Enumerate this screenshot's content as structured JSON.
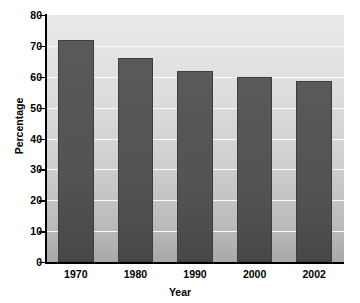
{
  "chart_data": {
    "type": "bar",
    "title": "",
    "subtitle": "",
    "xlabel": "Year",
    "ylabel": "Percentage",
    "categories": [
      "1970",
      "1980",
      "1990",
      "2000",
      "2002"
    ],
    "values": [
      72,
      66,
      62,
      60,
      58.5
    ],
    "ylim": [
      0,
      80
    ],
    "yticks": [
      0,
      10,
      20,
      30,
      40,
      50,
      60,
      70,
      80
    ],
    "ytick_labels": [
      "0",
      "10",
      "20",
      "30",
      "40",
      "50",
      "60",
      "70",
      "80"
    ],
    "grid": true,
    "grid_color": "#ffffff",
    "legend": null,
    "annotations": [],
    "series": [
      {
        "name": "Percentage",
        "values": [
          72,
          66,
          62,
          60,
          58.5
        ]
      }
    ],
    "colors": {
      "bar_top": "#5a5a5a",
      "bar_bottom": "#474747",
      "bar_border": "#3d3d3d",
      "plot_bg_top": "#e9e9e9",
      "plot_bg_bottom": "#a9a9a9",
      "axis": "#000000",
      "text": "#000000"
    }
  }
}
